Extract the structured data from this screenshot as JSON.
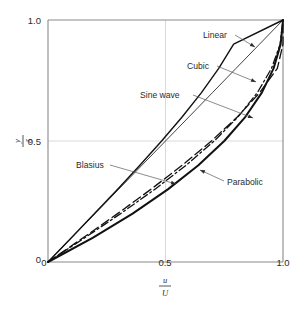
{
  "figure": {
    "background": "#ffffff",
    "axis_color": "#8a8a8a",
    "grid_color": "#cfcfcf",
    "curve_color": "#111111"
  },
  "axes": {
    "x_label_numerator": "u",
    "x_label_denominator": "U",
    "y_label_numerator": "y",
    "y_label_denominator": "δ",
    "x_ticks": [
      "0",
      "0.5",
      "1.0"
    ],
    "y_ticks": [
      "0",
      "0.5",
      "1.0"
    ]
  },
  "annotations": [
    {
      "name": "linear",
      "text": "Linear"
    },
    {
      "name": "cubic",
      "text": "Cubic"
    },
    {
      "name": "sine-wave",
      "text": "Sine wave"
    },
    {
      "name": "blasius",
      "text": "Blasius"
    },
    {
      "name": "parabolic",
      "text": "Parabolic"
    }
  ],
  "chart_data": {
    "type": "line",
    "title": "",
    "xlabel": "u/U",
    "ylabel": "y/δ",
    "xlim": [
      0,
      1
    ],
    "ylim": [
      0,
      1
    ],
    "xticks": [
      0,
      0.5,
      1.0
    ],
    "yticks": [
      0,
      0.5,
      1.0
    ],
    "grid": true,
    "legend": "annotated-leader-lines",
    "note": "Boundary-layer velocity profiles: dimensionless velocity u/U (x) versus dimensionless distance y/delta (y). All profiles pass through (0,0) and (1,1).",
    "series": [
      {
        "name": "Linear",
        "style": "solid-thin",
        "equation": "u/U = y/delta",
        "x": [
          0,
          0.1,
          0.2,
          0.3,
          0.4,
          0.5,
          0.6,
          0.7,
          0.8,
          0.9,
          1.0
        ],
        "y": [
          0,
          0.1,
          0.2,
          0.3,
          0.4,
          0.5,
          0.6,
          0.7,
          0.8,
          0.9,
          1.0
        ]
      },
      {
        "name": "Cubic",
        "style": "long-dash",
        "equation": "u/U = 1.5(y/delta) - 0.5(y/delta)^3",
        "x": [
          0,
          0.1493,
          0.296,
          0.4375,
          0.5712,
          0.6953,
          0.8064,
          0.9009,
          0.976,
          1.0,
          1.0
        ],
        "y": [
          0,
          0.1,
          0.2,
          0.3,
          0.4,
          0.5,
          0.6,
          0.7,
          0.8,
          0.9,
          1.0
        ]
      },
      {
        "name": "Sine wave",
        "style": "dash-dot",
        "equation": "u/U = sin(pi/2 * y/delta)",
        "x": [
          0,
          0.1564,
          0.309,
          0.454,
          0.5878,
          0.7071,
          0.809,
          0.891,
          0.9511,
          0.9877,
          1.0
        ],
        "y": [
          0,
          0.1,
          0.2,
          0.3,
          0.4,
          0.5,
          0.6,
          0.7,
          0.8,
          0.9,
          1.0
        ]
      },
      {
        "name": "Blasius",
        "style": "solid-medium",
        "equation": "Blasius exact laminar solution",
        "x": [
          0,
          0.0995,
          0.198,
          0.2955,
          0.391,
          0.4835,
          0.5715,
          0.653,
          0.7265,
          0.79,
          1.0
        ],
        "y": [
          0,
          0.1,
          0.2,
          0.3,
          0.4,
          0.5,
          0.6,
          0.7,
          0.8,
          0.9,
          1.0
        ],
        "approx": true
      },
      {
        "name": "Parabolic",
        "style": "solid-thick",
        "equation": "u/U = 2(y/delta) - (y/delta)^2",
        "x": [
          0,
          0.19,
          0.36,
          0.51,
          0.64,
          0.75,
          0.84,
          0.91,
          0.96,
          0.99,
          1.0
        ],
        "y": [
          0,
          0.1,
          0.2,
          0.3,
          0.4,
          0.5,
          0.6,
          0.7,
          0.8,
          0.9,
          1.0
        ]
      }
    ]
  }
}
